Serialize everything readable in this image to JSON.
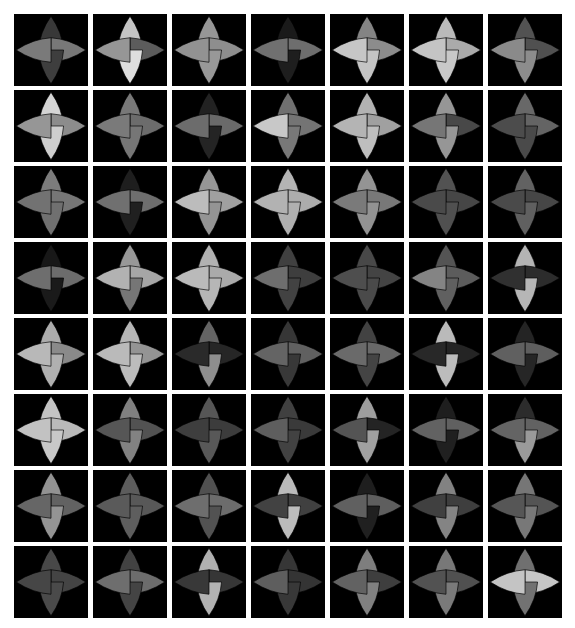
{
  "figure": {
    "title": "",
    "background_color": "#ffffff",
    "cell_background_color": "#000000",
    "grid_rows": 8,
    "grid_cols": 7,
    "cell_count": 56,
    "cell_width": 74,
    "cell_height": 72,
    "cell_gap_x": 5,
    "cell_gap_y": 4,
    "origin_x": 14,
    "origin_y": 14,
    "glyph_type": "four-pointed-concave-star",
    "petal_order": [
      "top",
      "right",
      "bottom",
      "left"
    ]
  },
  "chart_data": {
    "type": "heatmap",
    "title": "",
    "xlabel": "",
    "ylabel": "",
    "grid_rows": 8,
    "grid_cols": 7,
    "value_range": [
      0,
      255
    ],
    "channel_names": [
      "top",
      "right",
      "bottom",
      "left"
    ],
    "cells": [
      [
        {
          "top": 56,
          "right": 120,
          "bottom": 62,
          "left": 122
        },
        {
          "top": 196,
          "right": 92,
          "bottom": 222,
          "left": 150
        },
        {
          "top": 150,
          "right": 142,
          "bottom": 152,
          "left": 146
        },
        {
          "top": 26,
          "right": 110,
          "bottom": 30,
          "left": 112
        },
        {
          "top": 132,
          "right": 140,
          "bottom": 196,
          "left": 198
        },
        {
          "top": 186,
          "right": 170,
          "bottom": 200,
          "left": 196
        },
        {
          "top": 82,
          "right": 80,
          "bottom": 140,
          "left": 138
        }
      ],
      [
        {
          "top": 212,
          "right": 140,
          "bottom": 206,
          "left": 150
        },
        {
          "top": 120,
          "right": 108,
          "bottom": 118,
          "left": 122
        },
        {
          "top": 34,
          "right": 106,
          "bottom": 36,
          "left": 108
        },
        {
          "top": 112,
          "right": 116,
          "bottom": 120,
          "left": 200
        },
        {
          "top": 178,
          "right": 160,
          "bottom": 190,
          "left": 180
        },
        {
          "top": 150,
          "right": 72,
          "bottom": 150,
          "left": 118
        },
        {
          "top": 104,
          "right": 100,
          "bottom": 74,
          "left": 76
        }
      ],
      [
        {
          "top": 124,
          "right": 118,
          "bottom": 112,
          "left": 114
        },
        {
          "top": 30,
          "right": 110,
          "bottom": 32,
          "left": 112
        },
        {
          "top": 150,
          "right": 160,
          "bottom": 148,
          "left": 188
        },
        {
          "top": 180,
          "right": 172,
          "bottom": 176,
          "left": 178
        },
        {
          "top": 148,
          "right": 120,
          "bottom": 146,
          "left": 122
        },
        {
          "top": 82,
          "right": 70,
          "bottom": 80,
          "left": 74
        },
        {
          "top": 98,
          "right": 70,
          "bottom": 96,
          "left": 74
        }
      ],
      [
        {
          "top": 24,
          "right": 108,
          "bottom": 26,
          "left": 110
        },
        {
          "top": 152,
          "right": 166,
          "bottom": 118,
          "left": 178
        },
        {
          "top": 178,
          "right": 170,
          "bottom": 182,
          "left": 186
        },
        {
          "top": 64,
          "right": 62,
          "bottom": 66,
          "left": 110
        },
        {
          "top": 72,
          "right": 68,
          "bottom": 74,
          "left": 78
        },
        {
          "top": 84,
          "right": 92,
          "bottom": 96,
          "left": 132
        },
        {
          "top": 180,
          "right": 44,
          "bottom": 182,
          "left": 48
        }
      ],
      [
        {
          "top": 172,
          "right": 138,
          "bottom": 176,
          "left": 184
        },
        {
          "top": 182,
          "right": 148,
          "bottom": 188,
          "left": 186
        },
        {
          "top": 100,
          "right": 38,
          "bottom": 142,
          "left": 42
        },
        {
          "top": 54,
          "right": 96,
          "bottom": 56,
          "left": 100
        },
        {
          "top": 66,
          "right": 104,
          "bottom": 68,
          "left": 106
        },
        {
          "top": 186,
          "right": 36,
          "bottom": 188,
          "left": 40
        },
        {
          "top": 36,
          "right": 94,
          "bottom": 38,
          "left": 96
        }
      ],
      [
        {
          "top": 196,
          "right": 186,
          "bottom": 200,
          "left": 194
        },
        {
          "top": 128,
          "right": 82,
          "bottom": 130,
          "left": 86
        },
        {
          "top": 86,
          "right": 60,
          "bottom": 88,
          "left": 62
        },
        {
          "top": 64,
          "right": 58,
          "bottom": 66,
          "left": 94
        },
        {
          "top": 158,
          "right": 36,
          "bottom": 160,
          "left": 84
        },
        {
          "top": 30,
          "right": 96,
          "bottom": 32,
          "left": 98
        },
        {
          "top": 44,
          "right": 98,
          "bottom": 154,
          "left": 100
        }
      ],
      [
        {
          "top": 146,
          "right": 98,
          "bottom": 148,
          "left": 102
        },
        {
          "top": 92,
          "right": 88,
          "bottom": 94,
          "left": 90
        },
        {
          "top": 80,
          "right": 108,
          "bottom": 82,
          "left": 110
        },
        {
          "top": 186,
          "right": 64,
          "bottom": 188,
          "left": 66
        },
        {
          "top": 30,
          "right": 94,
          "bottom": 32,
          "left": 96
        },
        {
          "top": 130,
          "right": 62,
          "bottom": 132,
          "left": 64
        },
        {
          "top": 118,
          "right": 84,
          "bottom": 120,
          "left": 86
        }
      ],
      [
        {
          "top": 72,
          "right": 68,
          "bottom": 74,
          "left": 70
        },
        {
          "top": 66,
          "right": 108,
          "bottom": 68,
          "left": 110
        },
        {
          "top": 176,
          "right": 54,
          "bottom": 178,
          "left": 56
        },
        {
          "top": 54,
          "right": 52,
          "bottom": 56,
          "left": 94
        },
        {
          "top": 126,
          "right": 62,
          "bottom": 128,
          "left": 98
        },
        {
          "top": 120,
          "right": 80,
          "bottom": 122,
          "left": 82
        },
        {
          "top": 112,
          "right": 198,
          "bottom": 114,
          "left": 196
        }
      ]
    ]
  }
}
